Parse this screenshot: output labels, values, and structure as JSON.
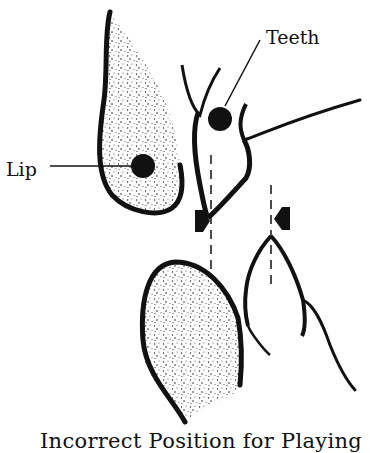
{
  "diagram": {
    "labels": {
      "lip": "Lip",
      "teeth": "Teeth"
    },
    "caption": "Incorrect Position for Playing",
    "parts": [
      "upper-lip",
      "upper-teeth",
      "lower-lip",
      "lower-teeth",
      "pressure-arrows",
      "alignment-guides"
    ],
    "colors": {
      "ink": "#111111",
      "background": "#ffffff"
    }
  }
}
